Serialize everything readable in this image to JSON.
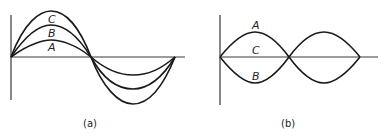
{
  "figure": {
    "panel_a": {
      "caption": "(a)",
      "labels": {
        "A": "A",
        "B": "B",
        "C": "C"
      },
      "description": "Three sine waves A, B, C of increasing amplitude, in phase, over one full period"
    },
    "panel_b": {
      "caption": "(b)",
      "labels": {
        "A": "A",
        "B": "B",
        "C": "C"
      },
      "description": "Standing wave envelope: A upper extreme, C equilibrium (flat), B lower extreme, with nodes"
    }
  }
}
